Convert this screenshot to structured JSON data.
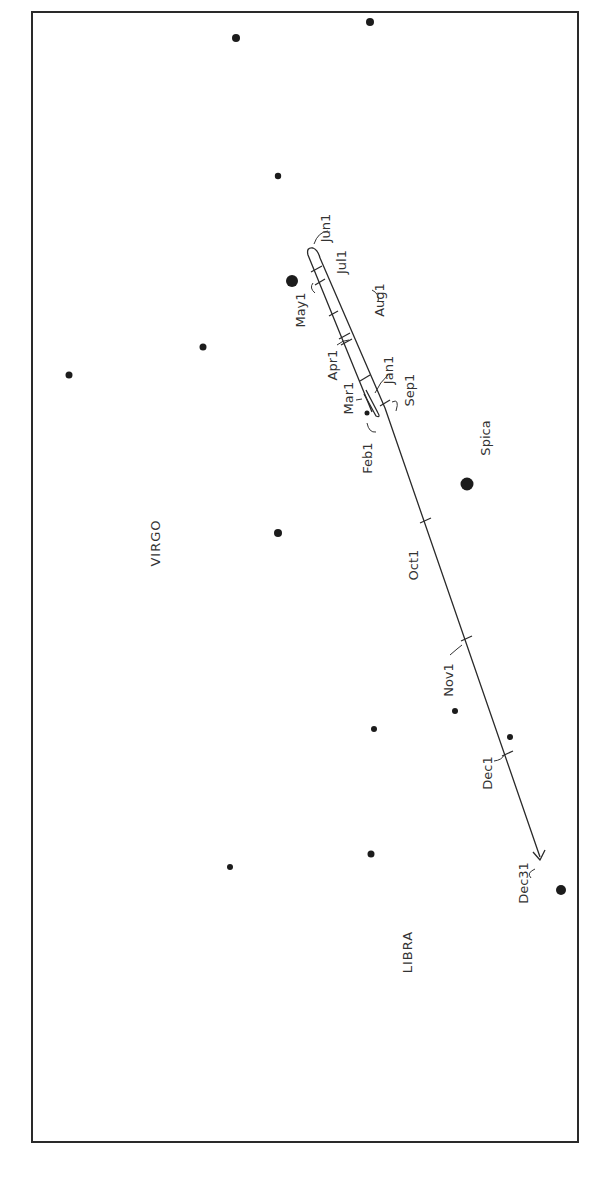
{
  "diagram": {
    "title": "",
    "constellations": [
      {
        "name": "VIRGO",
        "x": 160,
        "y": 543
      },
      {
        "name": "LIBRA",
        "x": 412,
        "y": 952
      }
    ],
    "named_stars": [
      {
        "name": "Spica",
        "x": 467,
        "y": 484,
        "r": 6.5,
        "label_x": 490,
        "label_y": 438
      }
    ],
    "stars": [
      {
        "x": 370,
        "y": 22,
        "r": 4
      },
      {
        "x": 236,
        "y": 38,
        "r": 4
      },
      {
        "x": 278,
        "y": 176,
        "r": 3.2
      },
      {
        "x": 292,
        "y": 281,
        "r": 6
      },
      {
        "x": 203,
        "y": 347,
        "r": 3.5
      },
      {
        "x": 69,
        "y": 375,
        "r": 3.5
      },
      {
        "x": 367,
        "y": 413,
        "r": 2.5
      },
      {
        "x": 278,
        "y": 533,
        "r": 4
      },
      {
        "x": 455,
        "y": 711,
        "r": 3
      },
      {
        "x": 374,
        "y": 729,
        "r": 3
      },
      {
        "x": 510,
        "y": 737,
        "r": 3
      },
      {
        "x": 230,
        "y": 867,
        "r": 3
      },
      {
        "x": 371,
        "y": 854,
        "r": 3.5
      },
      {
        "x": 561,
        "y": 890,
        "r": 5
      }
    ],
    "date_labels": [
      {
        "text": "Jan1",
        "x": 393,
        "y": 370
      },
      {
        "text": "Feb1",
        "x": 372,
        "y": 458
      },
      {
        "text": "Mar1",
        "x": 353,
        "y": 398
      },
      {
        "text": "Apr1",
        "x": 337,
        "y": 365
      },
      {
        "text": "May1",
        "x": 305,
        "y": 310
      },
      {
        "text": "Jun1",
        "x": 330,
        "y": 228
      },
      {
        "text": "Jul1",
        "x": 346,
        "y": 262
      },
      {
        "text": "Aug1",
        "x": 384,
        "y": 300
      },
      {
        "text": "Sep1",
        "x": 414,
        "y": 390
      },
      {
        "text": "Oct1",
        "x": 418,
        "y": 565
      },
      {
        "text": "Nov1",
        "x": 453,
        "y": 680
      },
      {
        "text": "Dec1",
        "x": 492,
        "y": 773
      },
      {
        "text": "Dec31",
        "x": 528,
        "y": 883
      }
    ]
  }
}
